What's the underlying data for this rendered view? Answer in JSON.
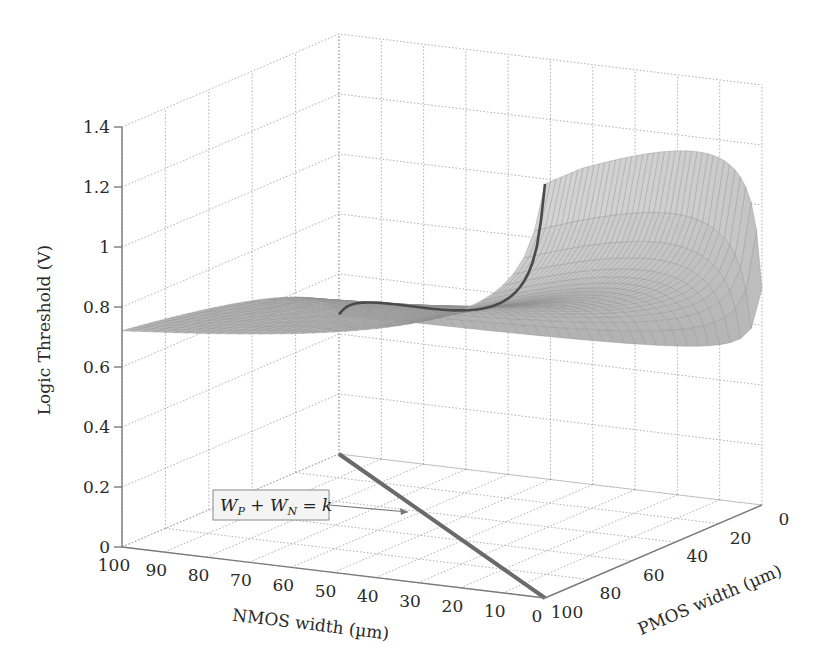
{
  "chart_data": {
    "type": "surface3d",
    "title": "",
    "xlabel": "NMOS width (µm)",
    "ylabel": "PMOS width (µm)",
    "zlabel": "Logic Threshold (V)",
    "x_ticks": [
      100,
      90,
      80,
      70,
      60,
      50,
      40,
      30,
      20,
      10,
      0
    ],
    "y_ticks": [
      0,
      20,
      40,
      60,
      80,
      100
    ],
    "z_ticks": [
      0,
      0.2,
      0.4,
      0.6,
      0.8,
      1,
      1.2,
      1.4
    ],
    "xlim": [
      0,
      100
    ],
    "ylim": [
      0,
      100
    ],
    "zlim": [
      0,
      1.4
    ],
    "grid": true,
    "surface": {
      "description": "Logic threshold VM as function of NMOS and PMOS widths; rises toward ~1.37 V as PMOS large / NMOS small, falls toward ~0.3 V as NMOS large / PMOS small",
      "sample_points": [
        {
          "nmos": 100,
          "pmos": 100,
          "vm": 0.73
        },
        {
          "nmos": 0.5,
          "pmos": 100,
          "vm": 1.37
        },
        {
          "nmos": 0.5,
          "pmos": 0.5,
          "vm": 0.78
        },
        {
          "nmos": 100,
          "pmos": 0.5,
          "vm": 0.3
        },
        {
          "nmos": 50,
          "pmos": 50,
          "vm": 0.78
        }
      ],
      "color": "#9a9a9a"
    },
    "highlight_curve": {
      "label": "W_P + W_N = k",
      "description": "Constraint line on floor from (NMOS=100,PMOS=0) to (NMOS=0,PMOS=100) and its projection onto the surface",
      "color": "#555555"
    },
    "annotation": {
      "text_parts": [
        "W",
        "P",
        " + W",
        "N",
        " = k"
      ]
    }
  },
  "labels": {
    "zlabel": "Logic Threshold (V)",
    "xlabel": "NMOS width (µm)",
    "ylabel": "PMOS width (µm)"
  }
}
